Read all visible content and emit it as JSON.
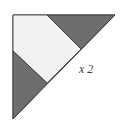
{
  "diagram": {
    "type": "quilt-block-setting-triangle",
    "label": "x 2",
    "colors": {
      "dark": "#6e6e6e",
      "light": "#f2f2f2",
      "outline": "#333333"
    }
  }
}
